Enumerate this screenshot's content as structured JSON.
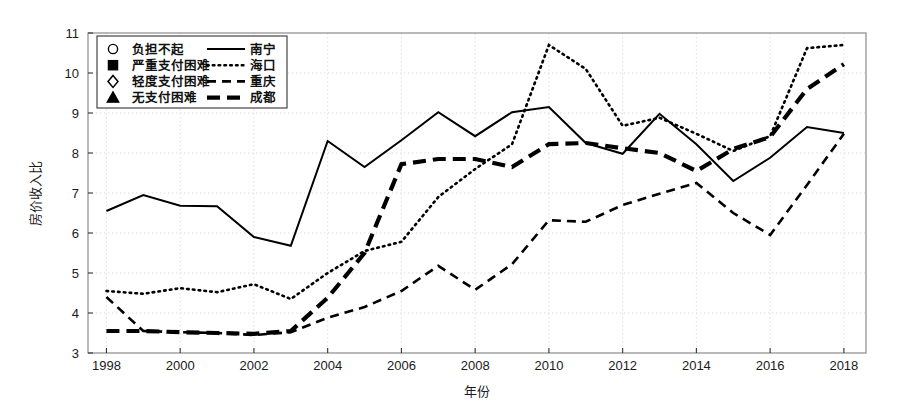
{
  "chart_data": {
    "type": "line",
    "title": "",
    "xlabel": "年份",
    "ylabel": "房价收入比",
    "x": [
      1998,
      1999,
      2000,
      2001,
      2002,
      2003,
      2004,
      2005,
      2006,
      2007,
      2008,
      2009,
      2010,
      2011,
      2012,
      2013,
      2014,
      2015,
      2016,
      2017,
      2018
    ],
    "xlim": [
      1997.5,
      2018.6
    ],
    "ylim": [
      3,
      11
    ],
    "xticks": [
      1998,
      2000,
      2002,
      2004,
      2006,
      2008,
      2010,
      2012,
      2014,
      2016,
      2018
    ],
    "yticks": [
      3,
      4,
      5,
      6,
      7,
      8,
      9,
      10,
      11
    ],
    "grid": true,
    "legend_position": "upper-left-inside",
    "series": [
      {
        "name": "南宁",
        "line_style": "solid",
        "values": [
          6.55,
          6.95,
          6.68,
          6.67,
          5.9,
          5.68,
          8.3,
          7.65,
          8.32,
          9.02,
          8.42,
          9.02,
          9.15,
          8.25,
          7.98,
          8.98,
          8.22,
          7.3,
          7.88,
          8.65,
          8.5
        ],
        "markers": [
          "severe",
          "mild",
          "none",
          "none",
          "mild",
          "mild",
          "mild",
          "mild",
          "mild",
          "severe",
          "severe",
          "mild",
          "mild",
          "none",
          "mild",
          "mild",
          "mild",
          "mild",
          "none",
          "none",
          "none"
        ]
      },
      {
        "name": "海口",
        "line_style": "dotted",
        "values": [
          4.55,
          4.48,
          4.62,
          4.52,
          4.72,
          4.35,
          5.0,
          5.55,
          5.78,
          6.9,
          7.6,
          8.22,
          10.7,
          10.1,
          8.68,
          8.88,
          8.48,
          8.05,
          8.42,
          10.62,
          10.7
        ],
        "markers": [
          "mild",
          "none",
          "none",
          "none",
          "none",
          "none",
          "none",
          "none",
          "none",
          "none",
          "none",
          "none",
          "severe",
          "mild",
          "severe",
          "none",
          "none",
          "none",
          "none",
          "none",
          "none"
        ]
      },
      {
        "name": "重庆",
        "line_style": "dashed",
        "values": [
          4.4,
          3.55,
          3.52,
          3.5,
          3.45,
          3.52,
          3.88,
          4.15,
          4.55,
          5.18,
          4.58,
          5.22,
          6.32,
          6.28,
          6.7,
          6.98,
          7.25,
          6.5,
          5.95,
          7.2,
          8.48
        ],
        "markers": [
          "mild",
          "none",
          "none",
          "none",
          "none",
          "none",
          "none",
          "none",
          "none",
          "mild",
          "mild",
          "none",
          "mild",
          "mild",
          "mild",
          "mild",
          "none",
          "none",
          "none",
          "none",
          "none"
        ]
      },
      {
        "name": "成都",
        "line_style": "thickdash",
        "values": [
          3.55,
          3.55,
          3.52,
          3.5,
          3.48,
          3.55,
          4.38,
          5.5,
          7.72,
          7.85,
          7.85,
          7.65,
          8.22,
          8.25,
          8.12,
          8.0,
          7.55,
          8.1,
          8.4,
          9.6,
          10.22
        ],
        "markers": [
          "mild",
          "none",
          "none",
          "none",
          "none",
          "none",
          "none",
          "none",
          "none",
          "none",
          "none",
          "none",
          "none",
          "none",
          "none",
          "none",
          "none",
          "none",
          "none",
          "none",
          "none"
        ]
      }
    ]
  },
  "legend": {
    "marker_entries": [
      {
        "symbol": "circle",
        "label": "负担不起"
      },
      {
        "symbol": "square",
        "label": "严重支付困难"
      },
      {
        "symbol": "diamond",
        "label": "轻度支付困难"
      },
      {
        "symbol": "triangle",
        "label": "无支付困难"
      }
    ],
    "line_entries": [
      {
        "style": "solid",
        "label": "南宁"
      },
      {
        "style": "dotted",
        "label": "海口"
      },
      {
        "style": "dashed",
        "label": "重庆"
      },
      {
        "style": "thickdash",
        "label": "成都"
      }
    ]
  },
  "colors": {
    "line": "#000000",
    "grid": "#d9d9d9",
    "axis": "#808080",
    "text": "#111111",
    "background": "#ffffff"
  }
}
